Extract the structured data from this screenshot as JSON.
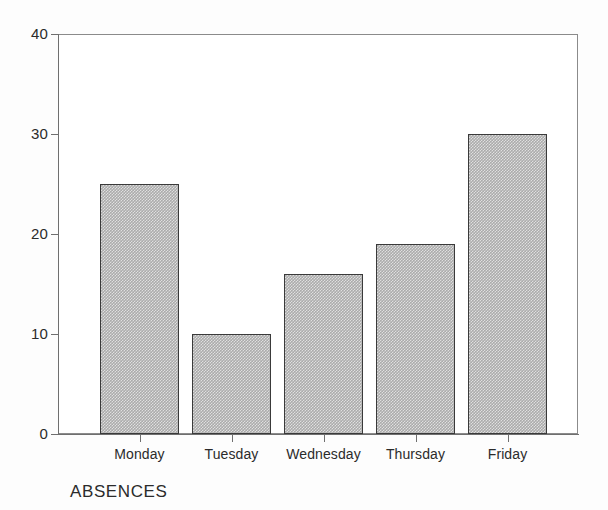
{
  "chart_data": {
    "type": "bar",
    "title": "",
    "caption": "ABSENCES",
    "xlabel": "",
    "ylabel": "",
    "categories": [
      "Monday",
      "Tuesday",
      "Wednesday",
      "Thursday",
      "Friday"
    ],
    "values": [
      25,
      10,
      16,
      19,
      30
    ],
    "ylim": [
      0,
      40
    ],
    "y_ticks": [
      0,
      10,
      20,
      30,
      40
    ],
    "y_tick_labels": [
      "0",
      "10",
      "20",
      "30",
      "40"
    ],
    "grid": false,
    "legend": null,
    "bar_fill_color": "#ababab",
    "bar_edge_color": "#3a3a3a",
    "axis_color": "#6f6f6f",
    "background_color": "#ffffff"
  },
  "axis": {
    "y_labels": [
      "40",
      "30",
      "20",
      "10",
      "0"
    ]
  },
  "bars": [
    {
      "label": "Monday",
      "value": "25"
    },
    {
      "label": "Tuesday",
      "value": "10"
    },
    {
      "label": "Wednesday",
      "value": "16"
    },
    {
      "label": "Thursday",
      "value": "19"
    },
    {
      "label": "Friday",
      "value": "30"
    }
  ],
  "caption": {
    "text": "ABSENCES"
  }
}
